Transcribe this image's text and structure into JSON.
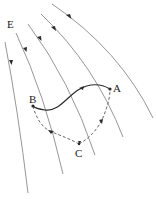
{
  "diagram": {
    "type": "electric-field-path-diagram",
    "labels": {
      "field": "E",
      "point_a": "A",
      "point_b": "B",
      "point_c": "C"
    },
    "field_lines_count": 5,
    "field_direction": "downward-left along curved lines",
    "paths": [
      {
        "name": "direct path",
        "from": "A",
        "to": "B",
        "style": "solid"
      },
      {
        "name": "indirect path",
        "via": "C",
        "points": [
          "A",
          "C",
          "B"
        ],
        "style": "dashed"
      }
    ],
    "colors": {
      "field_line": "#8a8a8a",
      "solid_path": "#2b2b2b",
      "dashed_path": "#6a6a6a",
      "text": "#222222"
    }
  }
}
